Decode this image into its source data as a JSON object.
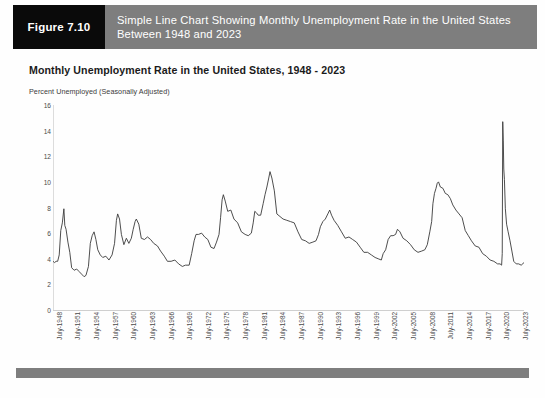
{
  "figure": {
    "badge_label": "Figure 7.10",
    "caption": "Simple Line Chart Showing Monthly Unemployment Rate in the United States Between 1948 and 2023",
    "badge_bg": "#0a0a0a",
    "caption_bg": "#7e7e7e",
    "caption_color": "#ffffff"
  },
  "chart_data": {
    "type": "line",
    "title": "Monthly Unemployment Rate in the United States, 1948 - 2023",
    "subtitle": "Percent Unemployed (Seasonally Adjusted)",
    "xlabel": "",
    "ylabel": "",
    "ylim": [
      0,
      16
    ],
    "yticks": [
      0,
      2,
      4,
      6,
      8,
      10,
      12,
      14,
      16
    ],
    "grid": false,
    "legend": false,
    "line_color": "#3a3a3a",
    "xtick_labels": [
      "July-1948",
      "July-1951",
      "July-1954",
      "July-1957",
      "July-1960",
      "July-1963",
      "July-1966",
      "July-1969",
      "July-1972",
      "July-1975",
      "July-1978",
      "July-1981",
      "July-1984",
      "July-1987",
      "July-1990",
      "July-1993",
      "July-1996",
      "July-1999",
      "July-2002",
      "July-2005",
      "July-2008",
      "July-2011",
      "July-2014",
      "July-2017",
      "July-2020",
      "July-2023"
    ],
    "xlim_years": [
      1948.0,
      2023.75
    ],
    "series": [
      {
        "name": "Unemployment Rate",
        "x": [
          1948.0,
          1948.25,
          1948.5,
          1948.75,
          1949.0,
          1949.25,
          1949.5,
          1949.75,
          1949.9,
          1950.1,
          1950.4,
          1950.7,
          1951.0,
          1951.4,
          1951.8,
          1952.2,
          1952.6,
          1953.0,
          1953.3,
          1953.7,
          1954.0,
          1954.3,
          1954.6,
          1954.9,
          1955.2,
          1955.6,
          1956.0,
          1956.5,
          1957.0,
          1957.5,
          1957.9,
          1958.2,
          1958.4,
          1958.7,
          1959.0,
          1959.4,
          1959.8,
          1960.2,
          1960.6,
          1960.9,
          1961.2,
          1961.4,
          1961.8,
          1962.2,
          1962.7,
          1963.2,
          1963.7,
          1964.2,
          1964.8,
          1965.3,
          1965.9,
          1966.4,
          1967.0,
          1967.6,
          1968.2,
          1968.8,
          1969.3,
          1969.9,
          1970.3,
          1970.7,
          1971.0,
          1971.4,
          1971.9,
          1972.4,
          1972.9,
          1973.4,
          1973.9,
          1974.3,
          1974.7,
          1974.95,
          1975.2,
          1975.4,
          1975.7,
          1976.1,
          1976.6,
          1977.1,
          1977.7,
          1978.3,
          1978.9,
          1979.4,
          1979.9,
          1980.2,
          1980.45,
          1980.7,
          1981.0,
          1981.4,
          1981.8,
          1982.1,
          1982.4,
          1982.7,
          1982.9,
          1983.2,
          1983.6,
          1984.0,
          1984.5,
          1985.0,
          1985.6,
          1986.2,
          1986.8,
          1987.4,
          1988.0,
          1988.6,
          1989.2,
          1989.8,
          1990.3,
          1990.7,
          1991.0,
          1991.4,
          1991.8,
          1992.2,
          1992.5,
          1992.8,
          1993.2,
          1993.8,
          1994.4,
          1995.0,
          1995.6,
          1996.2,
          1996.8,
          1997.4,
          1998.0,
          1998.6,
          1999.2,
          1999.8,
          2000.3,
          2000.8,
          2001.1,
          2001.5,
          2001.9,
          2002.3,
          2002.7,
          2003.1,
          2003.4,
          2003.8,
          2004.3,
          2004.9,
          2005.5,
          2006.1,
          2006.7,
          2007.3,
          2007.8,
          2008.2,
          2008.6,
          2008.9,
          2009.1,
          2009.35,
          2009.6,
          2009.8,
          2010.0,
          2010.3,
          2010.7,
          2011.1,
          2011.5,
          2011.9,
          2012.3,
          2012.8,
          2013.3,
          2013.8,
          2014.3,
          2014.8,
          2015.3,
          2015.9,
          2016.5,
          2017.1,
          2017.7,
          2018.3,
          2018.9,
          2019.5,
          2019.9,
          2020.15,
          2020.25,
          2020.33,
          2020.42,
          2020.5,
          2020.6,
          2020.75,
          2020.95,
          2021.2,
          2021.5,
          2021.8,
          2022.1,
          2022.5,
          2022.9,
          2023.3,
          2023.75
        ],
        "y": [
          3.8,
          3.7,
          3.8,
          3.8,
          4.3,
          6.2,
          6.8,
          7.9,
          6.6,
          6.3,
          5.3,
          4.5,
          3.3,
          3.1,
          3.2,
          3.0,
          2.8,
          2.6,
          2.7,
          3.4,
          5.2,
          5.8,
          6.1,
          5.5,
          4.7,
          4.3,
          4.1,
          4.2,
          3.9,
          4.3,
          5.2,
          7.0,
          7.5,
          7.1,
          5.9,
          5.1,
          5.6,
          5.2,
          5.6,
          6.3,
          6.9,
          7.1,
          6.7,
          5.6,
          5.5,
          5.7,
          5.5,
          5.2,
          5.0,
          4.6,
          4.2,
          3.8,
          3.8,
          3.9,
          3.6,
          3.4,
          3.5,
          3.5,
          4.4,
          5.4,
          5.9,
          5.9,
          6.0,
          5.7,
          5.5,
          4.9,
          4.8,
          5.3,
          5.9,
          7.2,
          8.6,
          9.0,
          8.5,
          7.7,
          7.8,
          7.1,
          6.8,
          6.1,
          5.9,
          5.8,
          6.0,
          6.8,
          7.7,
          7.6,
          7.4,
          7.4,
          8.3,
          9.0,
          9.6,
          10.3,
          10.8,
          10.3,
          9.3,
          7.5,
          7.3,
          7.1,
          7.0,
          6.9,
          6.8,
          6.1,
          5.5,
          5.4,
          5.2,
          5.3,
          5.4,
          5.9,
          6.5,
          6.9,
          7.1,
          7.5,
          7.8,
          7.4,
          7.0,
          6.6,
          6.1,
          5.6,
          5.7,
          5.5,
          5.3,
          4.9,
          4.5,
          4.5,
          4.3,
          4.1,
          4.0,
          3.9,
          4.4,
          4.7,
          5.5,
          5.8,
          5.8,
          5.9,
          6.3,
          6.1,
          5.6,
          5.4,
          5.1,
          4.7,
          4.5,
          4.6,
          4.7,
          5.1,
          6.1,
          6.9,
          8.3,
          9.1,
          9.5,
          9.9,
          10.0,
          9.6,
          9.5,
          9.1,
          9.0,
          8.7,
          8.2,
          7.8,
          7.5,
          7.2,
          6.2,
          5.8,
          5.4,
          5.0,
          4.9,
          4.4,
          4.2,
          3.9,
          3.8,
          3.6,
          3.6,
          3.5,
          4.4,
          14.7,
          13.2,
          11.0,
          10.2,
          7.9,
          6.7,
          6.1,
          5.4,
          4.6,
          3.8,
          3.6,
          3.6,
          3.5,
          3.7
        ]
      }
    ]
  },
  "bottom_rule": {
    "color": "#7e7e7e"
  }
}
